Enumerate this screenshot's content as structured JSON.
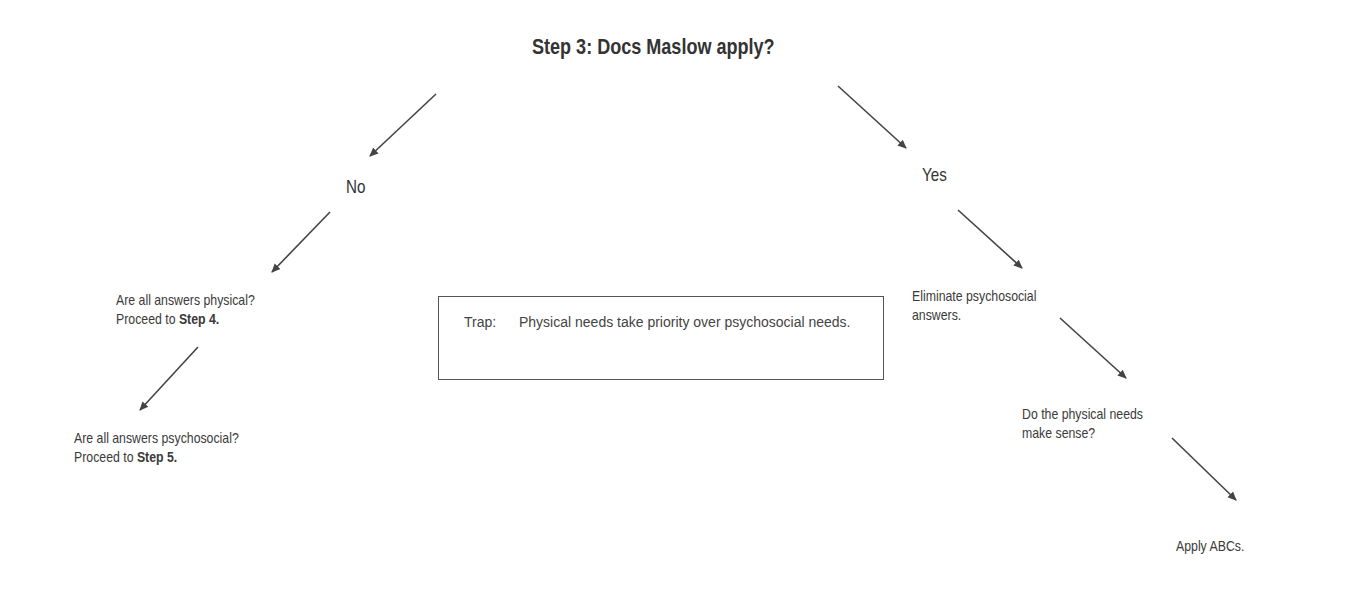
{
  "title": "Step 3:  Docs Maslow apply?",
  "branches": {
    "no": "No",
    "yes": "Yes"
  },
  "left": {
    "physical": {
      "line1": "Are all answers physical?",
      "line2_prefix": "Proceed to ",
      "line2_bold": "Step 4."
    },
    "psychosocial": {
      "line1": "Are all answers psychosocial?",
      "line2_prefix": "Proceed to ",
      "line2_bold": "Step 5."
    }
  },
  "trap": {
    "label": "Trap:",
    "text": "Physical needs take priority over psychosocial needs."
  },
  "right": {
    "eliminate": {
      "line1": "Eliminate psychosocial",
      "line2": "answers."
    },
    "physical_needs": {
      "line1": "Do the physical needs",
      "line2": "make sense?"
    },
    "apply": "Apply ABCs."
  },
  "colors": {
    "text": "#3a3a3a",
    "arrow": "#444444",
    "border": "#555555"
  }
}
